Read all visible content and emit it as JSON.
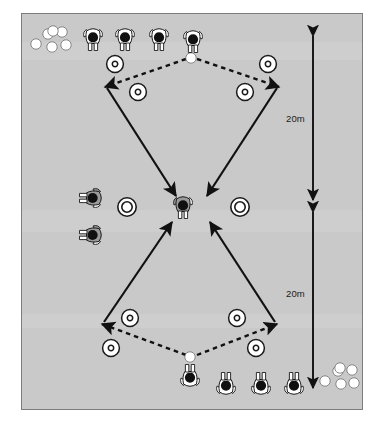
{
  "diagram": {
    "field": {
      "fill_color": "#c9c9c9",
      "border_color": "#7d7d7d",
      "x": 21,
      "y": 13,
      "width": 342,
      "height": 397
    },
    "measurements": [
      {
        "id": "top-distance",
        "label": "20m",
        "label_x": 286,
        "label_y": 113,
        "line_x": 313,
        "y_start": 36,
        "y_end": 200
      },
      {
        "id": "bottom-distance",
        "label": "20m",
        "label_x": 286,
        "label_y": 288,
        "line_x": 313,
        "y_start": 212,
        "y_end": 388
      }
    ],
    "cones": [
      {
        "id": "cone-top-left-outer",
        "x": 115,
        "y": 64,
        "style": "ring-dot"
      },
      {
        "id": "cone-top-right-outer",
        "x": 268,
        "y": 64,
        "style": "ring-dot"
      },
      {
        "id": "cone-top-left-inner",
        "x": 138,
        "y": 92,
        "style": "ring-dot"
      },
      {
        "id": "cone-top-right-inner",
        "x": 245,
        "y": 92,
        "style": "ring-dot"
      },
      {
        "id": "cone-mid-left",
        "x": 127,
        "y": 207,
        "style": "double-ring"
      },
      {
        "id": "cone-mid-right",
        "x": 240,
        "y": 207,
        "style": "double-ring"
      },
      {
        "id": "cone-bottom-left-inner",
        "x": 130,
        "y": 318,
        "style": "ring-dot"
      },
      {
        "id": "cone-bottom-right-inner",
        "x": 237,
        "y": 318,
        "style": "ring-dot"
      },
      {
        "id": "cone-bottom-left-outer",
        "x": 111,
        "y": 348,
        "style": "ring-dot"
      },
      {
        "id": "cone-bottom-right-outer",
        "x": 256,
        "y": 348,
        "style": "ring-dot"
      }
    ],
    "balls": [
      {
        "id": "ball-top-queue-1",
        "x": 36,
        "y": 44
      },
      {
        "id": "ball-top-queue-2",
        "x": 48,
        "y": 34
      },
      {
        "id": "ball-top-queue-3",
        "x": 52,
        "y": 47
      },
      {
        "id": "ball-top-queue-4",
        "x": 62,
        "y": 32
      },
      {
        "id": "ball-top-queue-5",
        "x": 66,
        "y": 45
      },
      {
        "id": "ball-top-queue-6",
        "x": 53,
        "y": 31
      },
      {
        "id": "ball-top-served",
        "x": 191,
        "y": 58
      },
      {
        "id": "ball-bottom-served",
        "x": 190,
        "y": 357
      },
      {
        "id": "ball-bottom-queue-1",
        "x": 325,
        "y": 381
      },
      {
        "id": "ball-bottom-queue-2",
        "x": 338,
        "y": 371
      },
      {
        "id": "ball-bottom-queue-3",
        "x": 341,
        "y": 384
      },
      {
        "id": "ball-bottom-queue-4",
        "x": 352,
        "y": 370
      },
      {
        "id": "ball-bottom-queue-5",
        "x": 354,
        "y": 383
      },
      {
        "id": "ball-bottom-queue-6",
        "x": 340,
        "y": 368
      }
    ],
    "players": [
      {
        "id": "player-top-1",
        "x": 93,
        "y": 38,
        "shade": "white",
        "rotation": 0
      },
      {
        "id": "player-top-2",
        "x": 125,
        "y": 38,
        "shade": "white",
        "rotation": 0
      },
      {
        "id": "player-top-3",
        "x": 159,
        "y": 38,
        "shade": "white",
        "rotation": 0
      },
      {
        "id": "player-top-4",
        "x": 193,
        "y": 40,
        "shade": "white",
        "rotation": 0
      },
      {
        "id": "player-left-waiting-1",
        "x": 92,
        "y": 198,
        "shade": "gray",
        "rotation": 90
      },
      {
        "id": "player-left-waiting-2",
        "x": 92,
        "y": 235,
        "shade": "gray",
        "rotation": 90
      },
      {
        "id": "player-center-working",
        "x": 183,
        "y": 206,
        "shade": "gray",
        "rotation": 0
      },
      {
        "id": "player-bottom-1",
        "x": 190,
        "y": 377,
        "shade": "white",
        "rotation": 180
      },
      {
        "id": "player-bottom-2",
        "x": 226,
        "y": 385,
        "shade": "white",
        "rotation": 180
      },
      {
        "id": "player-bottom-3",
        "x": 261,
        "y": 385,
        "shade": "white",
        "rotation": 180
      },
      {
        "id": "player-bottom-4",
        "x": 294,
        "y": 385,
        "shade": "white",
        "rotation": 180
      }
    ],
    "movement_runs": [
      {
        "id": "run-top-left",
        "from": [
          107,
          88
        ],
        "to": [
          176,
          196
        ],
        "style": "solid"
      },
      {
        "id": "run-top-right",
        "from": [
          277,
          88
        ],
        "to": [
          207,
          196
        ],
        "style": "solid"
      },
      {
        "id": "run-bottom-left",
        "from": [
          104,
          322
        ],
        "to": [
          172,
          222
        ],
        "style": "solid"
      },
      {
        "id": "run-bottom-right",
        "from": [
          275,
          322
        ],
        "to": [
          210,
          222
        ],
        "style": "solid"
      }
    ],
    "passes": [
      {
        "id": "pass-top-left",
        "from": [
          186,
          59
        ],
        "to": [
          105,
          87
        ],
        "style": "dashed"
      },
      {
        "id": "pass-top-right",
        "from": [
          197,
          59
        ],
        "to": [
          279,
          87
        ],
        "style": "dashed"
      },
      {
        "id": "pass-bottom-left",
        "from": [
          186,
          355
        ],
        "to": [
          102,
          324
        ],
        "style": "dashed"
      },
      {
        "id": "pass-bottom-right",
        "from": [
          197,
          355
        ],
        "to": [
          277,
          324
        ],
        "style": "dashed"
      }
    ],
    "legend_note": ""
  }
}
